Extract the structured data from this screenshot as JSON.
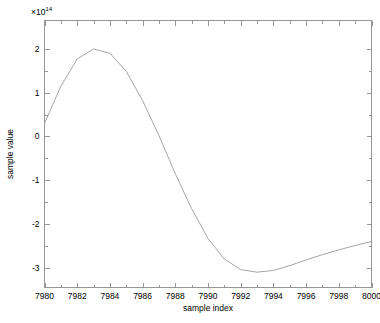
{
  "chart_data": {
    "type": "line",
    "title": "",
    "subtitle": "",
    "xlabel": "sample index",
    "ylabel": "sample value",
    "y_exponent_label": "×10",
    "y_exponent_value": "14",
    "y_multiplier": 100000000000000.0,
    "grid": false,
    "legend": null,
    "legend_position": "none",
    "xlim": [
      7980,
      8000
    ],
    "ylim": [
      -3.45,
      2.65
    ],
    "xticks": [
      7980,
      7982,
      7984,
      7986,
      7988,
      7990,
      7992,
      7994,
      7996,
      7998,
      8000
    ],
    "xticklabels": [
      "7980",
      "7982",
      "7984",
      "7986",
      "7988",
      "7990",
      "7992",
      "7994",
      "7996",
      "7998",
      "8000"
    ],
    "yticks": [
      2,
      1,
      0,
      -1,
      -2,
      -3
    ],
    "yticklabels": [
      "2",
      "1",
      "0",
      "-1",
      "-2",
      "-3"
    ],
    "x_minor_step": 1,
    "y_minor_step": 0.5,
    "series": [
      {
        "name": "sample value",
        "color": "#9a9a9a",
        "x": [
          7980,
          7981,
          7982,
          7983,
          7984,
          7985,
          7986,
          7987,
          7988,
          7989,
          7990,
          7991,
          7992,
          7993,
          7994,
          7995,
          7996,
          7997,
          7998,
          7999,
          8000
        ],
        "values": [
          0.3,
          1.15,
          1.77,
          2.0,
          1.9,
          1.49,
          0.82,
          0.02,
          -0.85,
          -1.65,
          -2.33,
          -2.8,
          -3.04,
          -3.1,
          -3.06,
          -2.95,
          -2.82,
          -2.7,
          -2.59,
          -2.49,
          -2.4
        ]
      }
    ]
  },
  "axes": {
    "x_axis_name": "sample index",
    "y_axis_name": "sample value"
  }
}
